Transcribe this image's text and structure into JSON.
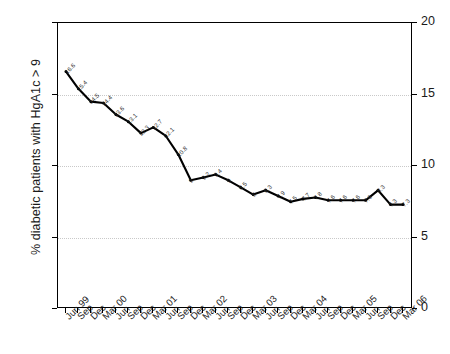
{
  "chart_data": {
    "type": "line",
    "title": "",
    "xlabel": "",
    "ylabel": "% diabetic patients with HgA1c > 9",
    "ylim": [
      0,
      20
    ],
    "yticks": [
      0,
      5,
      10,
      15,
      20
    ],
    "ytick_labels_left": [
      "0",
      "5",
      "10",
      "15",
      "20"
    ],
    "ytick_labels_right": [
      "0",
      "5",
      "10",
      "15",
      "20"
    ],
    "grid": "horizontal-dotted",
    "legend": "none",
    "dual_axis": true,
    "categories": [
      "Jun 99",
      "Sep",
      "Dec",
      "Mar 00",
      "Jun",
      "Sep",
      "Dec",
      "Mar 01",
      "Jun",
      "Sep",
      "Dec",
      "Mar 02",
      "Jun",
      "Sep",
      "Dec",
      "Mar 03",
      "Jun",
      "Sep",
      "Dec",
      "Mar 04",
      "Jun",
      "Sep",
      "Dec",
      "Mar 05",
      "Jun",
      "Sep",
      "Dec",
      "Mar 06"
    ],
    "values": [
      16.6,
      15.4,
      14.5,
      14.4,
      13.6,
      13.1,
      12.3,
      12.7,
      12.1,
      10.8,
      9.0,
      9.2,
      9.4,
      9.0,
      8.5,
      8.0,
      8.3,
      7.9,
      7.5,
      7.7,
      7.8,
      7.6,
      7.6,
      7.6,
      7.6,
      8.3,
      7.3,
      7.3
    ],
    "value_labels": [
      "16.6",
      "15.4",
      "14.5",
      "14.4",
      "13.6",
      "13.1",
      "12.3",
      "12.7",
      "12.1",
      "10.8",
      "9",
      "9.2",
      "9.4",
      "9",
      "8.5",
      "8",
      "8.3",
      "7.9",
      "7.5",
      "7.7",
      "7.8",
      "7.6",
      "7.6",
      "7.6",
      "7.6",
      "8.3",
      "7.3",
      "7.3"
    ],
    "series_color": "#000000",
    "marker": "circle"
  }
}
